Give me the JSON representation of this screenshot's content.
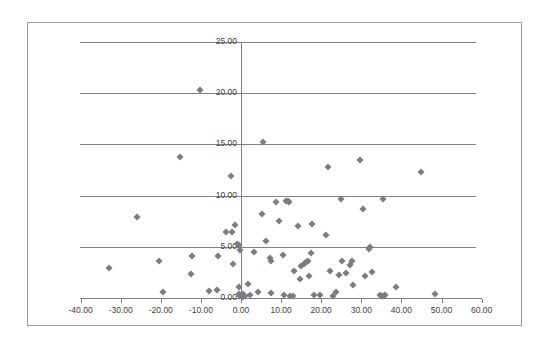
{
  "chart_data": {
    "type": "scatter",
    "title": "",
    "subtitle": "",
    "xlabel": "",
    "ylabel": "",
    "xlim": [
      -40,
      60
    ],
    "ylim": [
      0,
      25
    ],
    "grid": "horizontal",
    "legend": "none",
    "marker": {
      "shape": "diamond",
      "color": "#7b7b83",
      "size_px": 5
    },
    "x_ticks": [
      -40,
      -30,
      -20,
      -10,
      0,
      10,
      20,
      30,
      40,
      50,
      60
    ],
    "x_tick_labels": [
      "-40.00",
      "-30.00",
      "-20.00",
      "-10.00",
      "0.00",
      "10.00",
      "20.00",
      "30.00",
      "40.00",
      "50.00",
      "60.00"
    ],
    "y_ticks": [
      0,
      5,
      10,
      15,
      20,
      25
    ],
    "y_tick_labels": [
      "0.00",
      "5.00",
      "10.00",
      "15.00",
      "20.00",
      "25.00"
    ],
    "series": [
      {
        "name": "series-1",
        "points": [
          [
            -10.2,
            20.3
          ],
          [
            -15.2,
            13.8
          ],
          [
            -2.6,
            11.9
          ],
          [
            -26.0,
            7.9
          ],
          [
            -3.8,
            6.4
          ],
          [
            -2.3,
            6.4
          ],
          [
            -1.6,
            7.1
          ],
          [
            -0.9,
            5.3
          ],
          [
            -0.4,
            5.2
          ],
          [
            -0.2,
            4.7
          ],
          [
            -5.8,
            4.1
          ],
          [
            -12.3,
            4.1
          ],
          [
            -20.5,
            3.6
          ],
          [
            -33.0,
            2.9
          ],
          [
            -12.5,
            2.3
          ],
          [
            -6.0,
            0.8
          ],
          [
            -8.0,
            0.7
          ],
          [
            -19.5,
            0.6
          ],
          [
            -2.0,
            3.3
          ],
          [
            -0.6,
            1.1
          ],
          [
            -0.5,
            0.4
          ],
          [
            -0.3,
            0.2
          ],
          [
            0.2,
            0.2
          ],
          [
            0.5,
            0.4
          ],
          [
            0.6,
            0.1
          ],
          [
            1.0,
            0.2
          ],
          [
            1.8,
            1.4
          ],
          [
            2.2,
            0.3
          ],
          [
            4.3,
            0.6
          ],
          [
            5.5,
            15.2
          ],
          [
            5.3,
            8.2
          ],
          [
            3.3,
            4.5
          ],
          [
            6.3,
            5.6
          ],
          [
            7.4,
            3.6
          ],
          [
            7.2,
            3.9
          ],
          [
            8.7,
            9.4
          ],
          [
            9.5,
            7.5
          ],
          [
            10.5,
            4.2
          ],
          [
            11.2,
            9.5
          ],
          [
            11.7,
            9.5
          ],
          [
            11.9,
            9.4
          ],
          [
            7.6,
            0.5
          ],
          [
            10.8,
            0.3
          ],
          [
            12.2,
            0.2
          ],
          [
            13.0,
            0.2
          ],
          [
            13.3,
            2.6
          ],
          [
            14.2,
            7.0
          ],
          [
            14.8,
            1.9
          ],
          [
            15.0,
            3.1
          ],
          [
            15.6,
            3.3
          ],
          [
            16.2,
            3.5
          ],
          [
            16.8,
            3.6
          ],
          [
            17.7,
            7.2
          ],
          [
            17.5,
            4.4
          ],
          [
            17.0,
            2.1
          ],
          [
            18.3,
            0.3
          ],
          [
            19.6,
            0.3
          ],
          [
            21.6,
            12.8
          ],
          [
            21.3,
            6.2
          ],
          [
            22.1,
            2.6
          ],
          [
            22.9,
            0.2
          ],
          [
            23.8,
            0.6
          ],
          [
            24.5,
            2.2
          ],
          [
            25.0,
            9.7
          ],
          [
            25.2,
            3.6
          ],
          [
            26.2,
            2.4
          ],
          [
            27.3,
            3.2
          ],
          [
            27.8,
            3.6
          ],
          [
            28.0,
            1.3
          ],
          [
            29.8,
            13.5
          ],
          [
            30.5,
            8.7
          ],
          [
            31.0,
            2.1
          ],
          [
            31.8,
            4.8
          ],
          [
            32.2,
            5.0
          ],
          [
            32.6,
            2.5
          ],
          [
            35.3,
            9.7
          ],
          [
            34.6,
            0.3
          ],
          [
            35.2,
            0.2
          ],
          [
            35.6,
            0.2
          ],
          [
            36.0,
            0.3
          ],
          [
            38.7,
            1.1
          ],
          [
            44.9,
            12.3
          ],
          [
            48.4,
            0.4
          ]
        ]
      }
    ],
    "point_count": 83
  },
  "axes": {
    "x_axis_name": "x-axis",
    "y_axis_name": "y-axis"
  },
  "colors": {
    "marker": "#7b7b83",
    "gridline": "#808080",
    "border": "#9a9a9a",
    "tick_text": "#404040",
    "background": "#ffffff"
  }
}
